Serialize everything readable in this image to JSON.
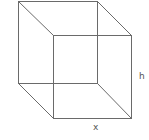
{
  "diagram": {
    "type": "wireframe-cube",
    "stroke_color": "#6a6a6a",
    "labels": {
      "height": "h",
      "width": "x"
    },
    "vertices": {
      "back_top_left": [
        18,
        1
      ],
      "back_top_right": [
        97,
        1
      ],
      "back_bottom_left": [
        18,
        83
      ],
      "back_bottom_right": [
        97,
        83
      ],
      "front_top_left": [
        53,
        35
      ],
      "front_top_right": [
        131,
        35
      ],
      "front_bottom_left": [
        53,
        118
      ],
      "front_bottom_right": [
        131,
        118
      ]
    }
  }
}
